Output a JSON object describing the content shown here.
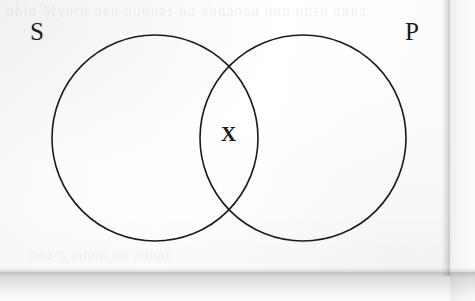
{
  "figure": {
    "type": "venn-diagram",
    "background_color": "#fdfdfd",
    "stroke_color": "#1a1a1a",
    "text_color": "#1b1b1b"
  },
  "labels": {
    "left_circle": "S",
    "right_circle": "P",
    "intersection_mark": "X"
  },
  "bleed_text": {
    "top": "nhin   Mynru  nan  nunnas  nu  annanau  nun  unsn  anna",
    "bottom": "nua n  mnnn  un annan"
  },
  "geometry": {
    "left_circle": {
      "cx": 155,
      "cy": 138,
      "r": 103
    },
    "right_circle": {
      "cx": 303,
      "cy": 138,
      "r": 103
    },
    "stroke_width": 1.6
  }
}
